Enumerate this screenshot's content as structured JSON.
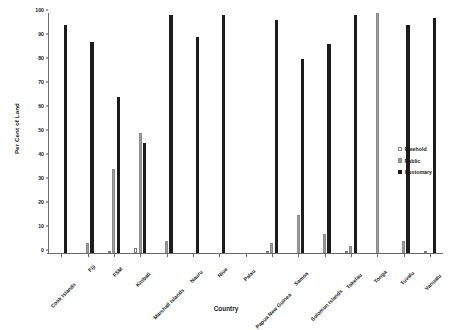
{
  "chart_data": {
    "type": "bar",
    "title": "",
    "xlabel": "Country",
    "ylabel": "Per Cent of Land",
    "ylim": [
      0,
      100
    ],
    "yticks": [
      0,
      10,
      20,
      30,
      40,
      50,
      60,
      70,
      80,
      90,
      100
    ],
    "grid": false,
    "legend_position": "right",
    "categories": [
      "Cook Islands",
      "Fiji",
      "FSM",
      "Kiribati",
      "Marshall Islands",
      "Nauru",
      "Niue",
      "Palau",
      "Papua New Guinea",
      "Samoa",
      "Solomon Islands",
      "Tokelau",
      "Tonga",
      "Tuvalu",
      "Vanuatu"
    ],
    "series": [
      {
        "name": "Freehold",
        "color": "#ffffff",
        "values": [
          0,
          0,
          1,
          2,
          0,
          0,
          0,
          0,
          1,
          0,
          0,
          1,
          0,
          0,
          1
        ]
      },
      {
        "name": "Public",
        "color": "#9e9e9e",
        "values": [
          0,
          4,
          35,
          50,
          5,
          0,
          0,
          0,
          4,
          16,
          8,
          3,
          100,
          5,
          0
        ]
      },
      {
        "name": "Customary",
        "color": "#1c1c1c",
        "values": [
          95,
          88,
          65,
          46,
          99,
          90,
          99,
          0,
          97,
          81,
          87,
          99,
          0,
          95,
          98
        ]
      }
    ]
  },
  "legend": {
    "items": [
      {
        "label": "Freehold",
        "swatch": "freehold"
      },
      {
        "label": "Public",
        "swatch": "public"
      },
      {
        "label": "Customary",
        "swatch": "customary"
      }
    ]
  }
}
